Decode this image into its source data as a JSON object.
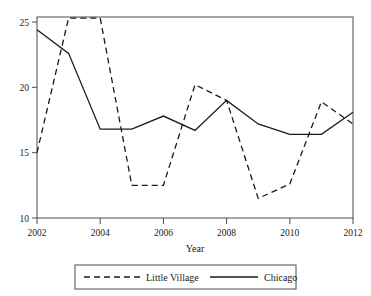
{
  "chart_data": {
    "type": "line",
    "title": "",
    "xlabel": "Year",
    "ylabel": "",
    "x": [
      2002,
      2003,
      2004,
      2005,
      2006,
      2007,
      2008,
      2009,
      2010,
      2011,
      2012
    ],
    "xlim": [
      2002,
      2012
    ],
    "ylim": [
      9.2,
      25.8
    ],
    "xticks": [
      "2002",
      "2004",
      "2006",
      "2008",
      "2010",
      "2012"
    ],
    "xtick_values": [
      2002,
      2004,
      2006,
      2008,
      2010,
      2012
    ],
    "yticks": [
      "25",
      "20",
      "15",
      "10"
    ],
    "ytick_values": [
      25,
      20,
      15,
      10
    ],
    "grid": false,
    "legend_position": "below",
    "series": [
      {
        "name": "Little Village",
        "style": "dashed",
        "color": "#1a1a1a",
        "values": [
          15.0,
          25.3,
          25.3,
          12.5,
          12.5,
          20.2,
          19.0,
          11.5,
          12.6,
          18.9,
          17.2
        ]
      },
      {
        "name": "Chicago",
        "style": "solid",
        "color": "#1a1a1a",
        "values": [
          24.4,
          22.6,
          16.8,
          16.8,
          17.8,
          16.7,
          19.0,
          17.2,
          16.4,
          16.4,
          18.1
        ]
      }
    ]
  },
  "legend": {
    "entries": [
      {
        "label": "Little Village",
        "style": "dashed"
      },
      {
        "label": "Chicago",
        "style": "solid"
      }
    ]
  },
  "axes": {
    "x_title": "Year"
  }
}
